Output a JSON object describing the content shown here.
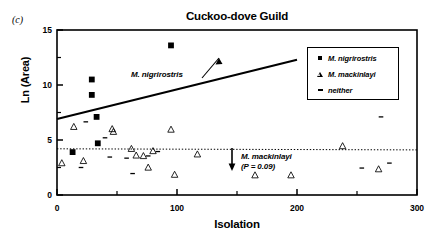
{
  "figure": {
    "panel_label": "(c)",
    "title": "Cuckoo-dove Guild"
  },
  "legend": {
    "entries": [
      {
        "label": "M. nigrirostris",
        "marker": "filled-square-icon"
      },
      {
        "label": "M. mackinlayi",
        "marker": "open-triangle-icon"
      },
      {
        "label": "neither",
        "marker": "small-dash-icon"
      }
    ]
  },
  "annotations": {
    "nigrirostris_label": "M. nigrirostris",
    "mackinlayi_label": "M. mackinlayi",
    "mackinlayi_pvalue": "(P = 0.09)"
  },
  "axes": {
    "x_tick_labels": [
      "0",
      "100",
      "200",
      "300"
    ],
    "y_tick_labels": [
      "0",
      "5",
      "10",
      "15"
    ]
  },
  "chart_data": {
    "type": "scatter",
    "title": "Cuckoo-dove Guild",
    "panel": "(c)",
    "xlabel": "Isolation",
    "ylabel": "Ln (Area)",
    "xlim": [
      0,
      300
    ],
    "ylim": [
      0,
      15
    ],
    "xticks": [
      0,
      100,
      200,
      300
    ],
    "yticks": [
      0,
      5,
      10,
      15
    ],
    "x_minor_tick_interval": 50,
    "y_minor_tick_interval": 2.5,
    "grid": false,
    "legend_position": "top-right-inside",
    "series": [
      {
        "name": "M. nigrirostris",
        "marker": "filled-square",
        "points": [
          [
            29,
            10.5
          ],
          [
            29,
            9.1
          ],
          [
            33,
            7.1
          ],
          [
            34,
            4.7
          ],
          [
            13,
            3.9
          ],
          [
            95,
            13.6
          ]
        ]
      },
      {
        "name": "M. mackinlayi",
        "marker": "open-triangle",
        "points": [
          [
            4,
            2.9
          ],
          [
            14,
            6.2
          ],
          [
            22,
            3.1
          ],
          [
            46,
            6.0
          ],
          [
            47,
            5.75
          ],
          [
            62,
            4.2
          ],
          [
            66,
            3.6
          ],
          [
            72,
            3.55
          ],
          [
            76,
            2.5
          ],
          [
            80,
            4.0
          ],
          [
            95,
            5.95
          ],
          [
            98,
            1.85
          ],
          [
            117,
            3.7
          ],
          [
            165,
            1.8
          ],
          [
            195,
            1.8
          ],
          [
            238,
            4.45
          ],
          [
            268,
            2.35
          ]
        ]
      },
      {
        "name": "neither",
        "marker": "small-dash",
        "points": [
          [
            24,
            6.65
          ],
          [
            20,
            2.5
          ],
          [
            40,
            5.2
          ],
          [
            44,
            3.45
          ],
          [
            58,
            3.35
          ],
          [
            63,
            1.95
          ],
          [
            76,
            3.55
          ],
          [
            84,
            3.95
          ],
          [
            254,
            2.45
          ],
          [
            270,
            7.1
          ],
          [
            277,
            2.9
          ]
        ]
      }
    ],
    "lines": [
      {
        "name": "M. nigrirostris regression",
        "style": "solid",
        "x": [
          0,
          200
        ],
        "y": [
          6.9,
          12.3
        ]
      },
      {
        "name": "M. mackinlayi regression",
        "style": "dotted",
        "x": [
          0,
          300
        ],
        "y": [
          4.2,
          4.1
        ]
      }
    ]
  }
}
